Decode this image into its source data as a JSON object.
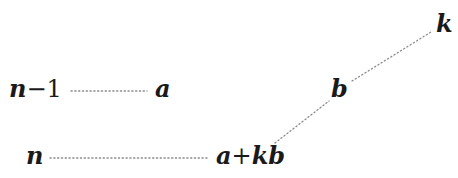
{
  "diagram": {
    "type": "graph",
    "nodes": [
      {
        "id": "n_minus_1",
        "label": "n−1",
        "parts": [
          "n",
          "−1"
        ]
      },
      {
        "id": "a",
        "label": "a"
      },
      {
        "id": "n",
        "label": "n"
      },
      {
        "id": "a_plus_kb",
        "label": "a+kb",
        "parts": [
          "a",
          "+",
          "kb"
        ]
      },
      {
        "id": "b",
        "label": "b"
      },
      {
        "id": "k",
        "label": "k"
      }
    ],
    "edges": [
      {
        "from": "n_minus_1",
        "to": "a",
        "style": "dotted"
      },
      {
        "from": "n",
        "to": "a_plus_kb",
        "style": "dotted"
      },
      {
        "from": "a_plus_kb",
        "to": "b",
        "style": "dotted"
      },
      {
        "from": "b",
        "to": "k",
        "style": "dotted"
      }
    ],
    "colors": {
      "text": "#1a1a1a",
      "edge": "#8a8a8a",
      "background": "#ffffff"
    }
  }
}
